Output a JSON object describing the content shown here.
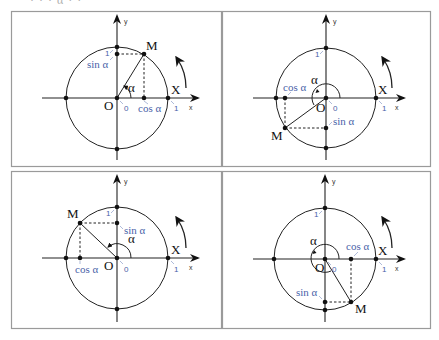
{
  "header_fragment": "· · · α · ·",
  "colors": {
    "label_blue": "#4a62a8",
    "border": "#9a9a9a",
    "ink": "#222222"
  },
  "common_labels": {
    "y_axis": "y",
    "x_axis": "x",
    "origin": "O",
    "x_point": "X",
    "point_m": "M",
    "angle": "α",
    "zero": "0",
    "one_x": "1",
    "one_y": "1",
    "sin": "sin α",
    "cos": "cos α"
  },
  "panels": [
    {
      "position": "top-left",
      "quadrant": "I",
      "labels": {
        "M": "M",
        "alpha": "α",
        "O": "O",
        "X": "X",
        "sin": "sin α",
        "cos": "cos α",
        "zero": "0",
        "one_x": "1",
        "one_y": "1",
        "x": "x",
        "y": "y"
      }
    },
    {
      "position": "top-right",
      "quadrant": "III",
      "labels": {
        "M": "M",
        "alpha": "α",
        "O": "O",
        "X": "X",
        "sin": "sin α",
        "cos": "cos α",
        "zero": "0",
        "one_x": "1",
        "one_y": "1",
        "x": "x",
        "y": "y"
      }
    },
    {
      "position": "bottom-left",
      "quadrant": "II",
      "labels": {
        "M": "M",
        "alpha": "α",
        "O": "O",
        "X": "X",
        "sin": "sin α",
        "cos": "cos α",
        "zero": "0",
        "one_x": "1",
        "one_y": "1",
        "x": "x",
        "y": "y"
      }
    },
    {
      "position": "bottom-right",
      "quadrant": "IV",
      "labels": {
        "M": "M",
        "alpha": "α",
        "O": "O",
        "X": "X",
        "sin": "sin α",
        "cos": "cos α",
        "zero": "0",
        "one_x": "1",
        "one_y": "1",
        "x": "x",
        "y": "y"
      }
    }
  ]
}
